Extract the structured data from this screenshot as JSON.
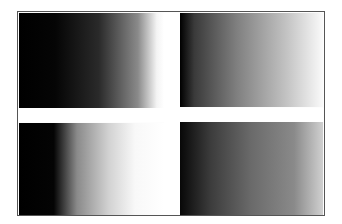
{
  "image": {
    "description": "Four grayscale gradient panels separated by a white cross inside a thin dark frame",
    "panels": [
      {
        "position": "top-left",
        "gradient": "black to white",
        "start_color": "#000000",
        "end_color": "#ffffff"
      },
      {
        "position": "top-right",
        "gradient": "black to white",
        "start_color": "#000000",
        "end_color": "#fafafa"
      },
      {
        "position": "bottom-left",
        "gradient": "black to white (steep)",
        "start_color": "#000000",
        "end_color": "#ffffff"
      },
      {
        "position": "bottom-right",
        "gradient": "black to gray",
        "start_color": "#060606",
        "end_color": "#d0d0d0"
      }
    ],
    "frame_color": "#555555",
    "divider_color": "#ffffff"
  }
}
